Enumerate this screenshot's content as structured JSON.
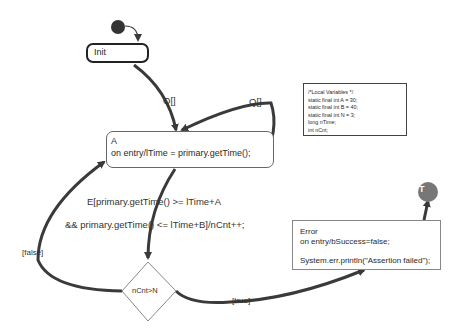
{
  "diagram": {
    "type": "UML state machine",
    "states": [
      {
        "id": "init",
        "name": "Init"
      },
      {
        "id": "a",
        "name": "A",
        "entry": "on entry/lTime = primary.getTime();"
      },
      {
        "id": "error",
        "name": "Error",
        "entry": "on entry/bSuccess=false;",
        "action": "System.err.println(\"Assertion failed\");"
      }
    ],
    "initial_node": "initial-pseudostate",
    "final_node": {
      "label": "T"
    },
    "choice": {
      "label": "nCnt>N"
    },
    "transitions": [
      {
        "from": "init",
        "to": "a",
        "label": "Q[]"
      },
      {
        "from": "a",
        "to": "a",
        "label": "Q[]"
      },
      {
        "from": "a",
        "to": "choice",
        "label_line1": "E[primary.getTime() >= lTime+A",
        "label_line2": "&& primary.getTime() <= lTime+B]/nCnt++;"
      },
      {
        "from": "choice",
        "to": "a",
        "label": "[false]"
      },
      {
        "from": "choice",
        "to": "error",
        "label": "[true]"
      },
      {
        "from": "error",
        "to": "final",
        "label": ""
      }
    ],
    "note": {
      "lines": [
        "/*Local Variables */",
        "static final int A = 30;",
        "static final int B = 40;",
        "static final int N = 3;",
        "long nTime;",
        "int nCnt;"
      ]
    },
    "colors": {
      "edge": "#3a3a3a",
      "initial": "#333333",
      "final": "#777777"
    }
  }
}
